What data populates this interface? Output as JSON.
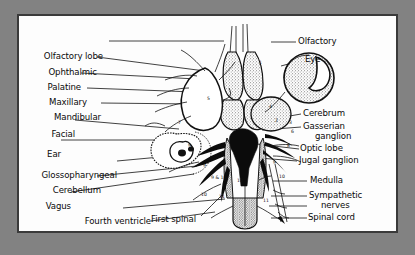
{
  "figure": {
    "kind": "anatomical-illustration",
    "frame_color": "#828282",
    "plate_color": "#fdfdfd",
    "ink_color": "#111111"
  },
  "labels_left": [
    {
      "text": "Olfactory lobe",
      "y": 41
    },
    {
      "text": "Ophthalmic",
      "y": 57
    },
    {
      "text": "Palatine",
      "y": 73
    },
    {
      "text": "Maxillary",
      "y": 88
    },
    {
      "text": "Mandibular",
      "y": 103
    },
    {
      "text": "Facial",
      "y": 120
    },
    {
      "text": "Ear",
      "y": 140
    },
    {
      "text": "Glossopharyngeal",
      "y": 161
    },
    {
      "text": "Cerebellum",
      "y": 176
    },
    {
      "text": "Vagus",
      "y": 192
    },
    {
      "text": "Fourth ventricle",
      "y": 208
    }
  ],
  "labels_right": [
    {
      "text": "Olfactory",
      "y": 41
    },
    {
      "text": "Eye",
      "y": 59
    },
    {
      "text": "Cerebrum",
      "y": 113
    },
    {
      "text": "Gasserian",
      "y": 126
    },
    {
      "text": "ganglion",
      "y": 136
    },
    {
      "text": "Optic lobe",
      "y": 148
    },
    {
      "text": "Jugal ganglion",
      "y": 160
    },
    {
      "text": "Medulla",
      "y": 180
    },
    {
      "text": "Sympathetic",
      "y": 195
    },
    {
      "text": "nerves",
      "y": 205
    },
    {
      "text": "Spinal cord",
      "y": 217
    }
  ],
  "labels_bottom": [
    {
      "text": "First spinal",
      "y": 222
    }
  ],
  "nerve_numbers": [
    "1",
    "2",
    "3",
    "4",
    "5",
    "6",
    "7",
    "8",
    "9",
    "9 & 10",
    "10",
    "11"
  ]
}
